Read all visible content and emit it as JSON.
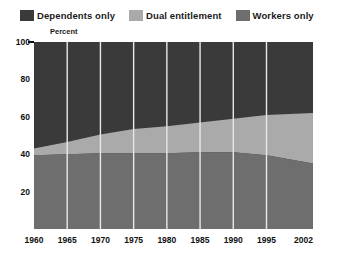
{
  "legend": {
    "items": [
      {
        "label": "Dependents only",
        "color": "#3a3a3a",
        "icon": "legend-swatch-icon"
      },
      {
        "label": "Dual entitlement",
        "color": "#aaaaaa",
        "icon": "legend-swatch-icon"
      },
      {
        "label": "Workers only",
        "color": "#6e6e6e",
        "icon": "legend-swatch-icon"
      }
    ]
  },
  "axis_title": "Percent",
  "chart_data": {
    "type": "area",
    "title": "",
    "subtitle": "",
    "xlabel": "",
    "ylabel": "Percent",
    "ylim": [
      0,
      100
    ],
    "yticks": [
      0,
      20,
      40,
      60,
      80,
      100
    ],
    "ytick_labels": [
      "",
      "20",
      "40",
      "60",
      "80",
      "100"
    ],
    "xlim": [
      1960,
      2002
    ],
    "x": [
      1960,
      1965,
      1970,
      1975,
      1980,
      1985,
      1990,
      1995,
      2002
    ],
    "xtick_labels": [
      "1960",
      "1965",
      "1970",
      "1975",
      "1980",
      "1985",
      "1990",
      "1995",
      "2002"
    ],
    "grid": true,
    "gridline_color": "#e8e8e8",
    "stacked": true,
    "stack_total": 100,
    "legend_position": "top",
    "series": [
      {
        "name": "Workers only",
        "color": "#6e6e6e",
        "values": [
          39.5,
          40.0,
          40.5,
          40.5,
          40.5,
          41.0,
          41.0,
          39.5,
          35.0
        ]
      },
      {
        "name": "Dual entitlement",
        "color": "#aaaaaa",
        "values": [
          3.5,
          6.5,
          10.0,
          13.0,
          14.5,
          16.0,
          18.0,
          21.5,
          27.0
        ]
      },
      {
        "name": "Dependents only",
        "color": "#3a3a3a",
        "values": [
          57.0,
          53.5,
          49.5,
          46.5,
          45.0,
          43.0,
          41.0,
          39.0,
          38.0
        ]
      }
    ],
    "cumulative_boundaries": {
      "workers_only_top": [
        39.5,
        40.0,
        40.5,
        40.5,
        40.5,
        41.0,
        41.0,
        39.5,
        35.0
      ],
      "dual_entitlement_top": [
        43.0,
        46.5,
        50.5,
        53.5,
        55.0,
        57.0,
        59.0,
        61.0,
        62.0
      ]
    }
  }
}
